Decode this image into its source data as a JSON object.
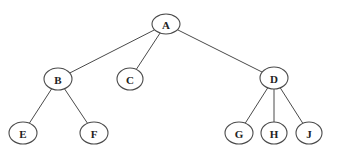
{
  "diagram": {
    "type": "tree",
    "colors": {
      "line": "#4a4a4a",
      "node_fill": "#ffffff",
      "label": "#222222"
    },
    "nodes": [
      {
        "id": "A",
        "label": "A",
        "x": 166,
        "y": 24,
        "rx": 14,
        "ry": 10
      },
      {
        "id": "B",
        "label": "B",
        "x": 58,
        "y": 79,
        "rx": 14,
        "ry": 11
      },
      {
        "id": "C",
        "label": "C",
        "x": 130,
        "y": 79,
        "rx": 13,
        "ry": 11
      },
      {
        "id": "D",
        "label": "D",
        "x": 274,
        "y": 78,
        "rx": 14,
        "ry": 11
      },
      {
        "id": "E",
        "label": "E",
        "x": 23,
        "y": 133,
        "rx": 14,
        "ry": 11
      },
      {
        "id": "F",
        "label": "F",
        "x": 94,
        "y": 133,
        "rx": 14,
        "ry": 11
      },
      {
        "id": "G",
        "label": "G",
        "x": 239,
        "y": 133,
        "rx": 14,
        "ry": 11
      },
      {
        "id": "H",
        "label": "H",
        "x": 274,
        "y": 133,
        "rx": 13,
        "ry": 11
      },
      {
        "id": "J",
        "label": "J",
        "x": 309,
        "y": 133,
        "rx": 13,
        "ry": 11
      }
    ],
    "edges": [
      {
        "from": "A",
        "to": "B"
      },
      {
        "from": "A",
        "to": "C"
      },
      {
        "from": "A",
        "to": "D"
      },
      {
        "from": "B",
        "to": "E"
      },
      {
        "from": "B",
        "to": "F"
      },
      {
        "from": "D",
        "to": "G"
      },
      {
        "from": "D",
        "to": "H"
      },
      {
        "from": "D",
        "to": "J"
      }
    ]
  }
}
